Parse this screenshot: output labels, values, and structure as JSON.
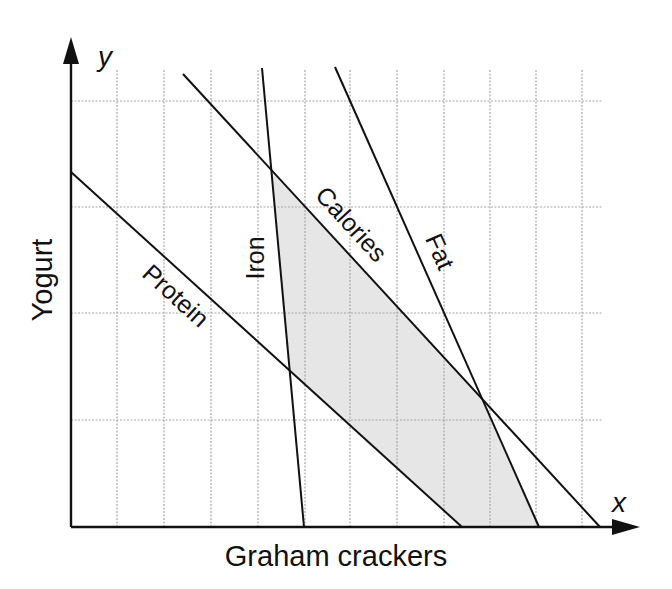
{
  "diagram": {
    "type": "linear-programming-feasible-region",
    "x_axis": {
      "variable": "x",
      "title": "Graham crackers"
    },
    "y_axis": {
      "variable": "y",
      "title": "Yogurt"
    },
    "constraint_lines": [
      {
        "name": "Protein",
        "label": "Protein"
      },
      {
        "name": "Iron",
        "label": "Iron"
      },
      {
        "name": "Calories",
        "label": "Calories"
      },
      {
        "name": "Fat",
        "label": "Fat"
      }
    ],
    "feasible_region": {
      "fill": "#e6e6e6",
      "bounded_by": [
        "Iron",
        "Calories",
        "Fat",
        "Protein",
        "x-axis"
      ]
    },
    "grid": {
      "vertical_lines": 11,
      "horizontal_lines": 4,
      "style": "dotted"
    }
  }
}
